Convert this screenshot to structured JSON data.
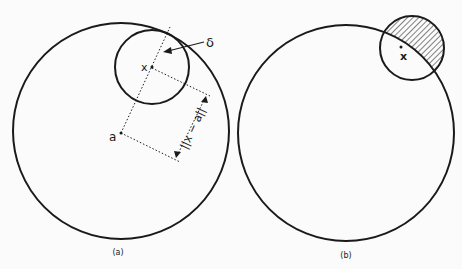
{
  "figure": {
    "panel_a": {
      "caption": "(a)",
      "point_x_label": "x",
      "point_a_label": "a",
      "radius_label": "δ",
      "distance_label": "||x − a||"
    },
    "panel_b": {
      "caption": "(b)",
      "point_x_label": "x"
    }
  },
  "colors": {
    "stroke": "#1a1a1a",
    "background": "#fbfbfb"
  }
}
